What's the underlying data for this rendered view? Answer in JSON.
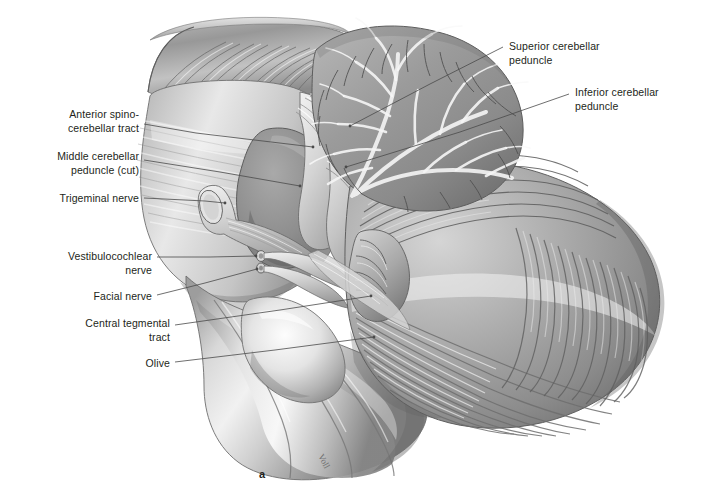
{
  "figure": {
    "panel_letter": "a",
    "signature": "Voll",
    "background_color": "#ffffff",
    "ink_color": "#231f20",
    "leader_color": "#4a4a4a"
  },
  "labels": [
    {
      "id": "anterior-spinocerebellar-tract",
      "lines": [
        "Anterior spino-",
        "cerebellar tract"
      ],
      "align": "right",
      "text_right": 139,
      "text_top": 108,
      "leader": [
        [
          144,
          124
        ],
        [
          196,
          133
        ],
        [
          313,
          147
        ]
      ]
    },
    {
      "id": "middle-cerebellar-peduncle-cut",
      "lines": [
        "Middle cerebellar",
        "peduncle (cut)"
      ],
      "align": "right",
      "text_top": 150,
      "text_right": 139,
      "leader": [
        [
          144,
          160
        ],
        [
          220,
          172
        ],
        [
          300,
          186
        ]
      ]
    },
    {
      "id": "trigeminal-nerve",
      "lines": [
        "Trigeminal nerve"
      ],
      "align": "right",
      "text_top": 192,
      "text_right": 139,
      "leader": [
        [
          144,
          198
        ],
        [
          205,
          201
        ],
        [
          225,
          203
        ]
      ]
    },
    {
      "id": "vestibulocochlear-nerve",
      "lines": [
        "Vestibulocochlear",
        "nerve"
      ],
      "align": "right",
      "text_top": 250,
      "text_right": 152,
      "leader": [
        [
          157,
          257
        ],
        [
          210,
          257
        ],
        [
          256,
          256
        ]
      ]
    },
    {
      "id": "facial-nerve",
      "lines": [
        "Facial nerve"
      ],
      "align": "right",
      "text_top": 290,
      "text_right": 152,
      "leader": [
        [
          157,
          295
        ],
        [
          205,
          283
        ],
        [
          257,
          269
        ]
      ]
    },
    {
      "id": "central-tegmental-tract",
      "lines": [
        "Central tegmental",
        "tract"
      ],
      "align": "right",
      "text_top": 317,
      "text_right": 170,
      "leader": [
        [
          175,
          325
        ],
        [
          280,
          310
        ],
        [
          371,
          296
        ]
      ]
    },
    {
      "id": "olive",
      "lines": [
        "Olive"
      ],
      "align": "right",
      "text_top": 357,
      "text_right": 170,
      "leader": [
        [
          175,
          362
        ],
        [
          275,
          350
        ],
        [
          374,
          337
        ]
      ]
    },
    {
      "id": "superior-cerebellar-peduncle",
      "lines": [
        "Superior cerebellar",
        "peduncle"
      ],
      "align": "left",
      "text_top": 40,
      "text_left": 509,
      "leader": [
        [
          503,
          47
        ],
        [
          430,
          84
        ],
        [
          350,
          126
        ]
      ]
    },
    {
      "id": "inferior-cerebellar-peduncle",
      "lines": [
        "Inferior cerebellar",
        "peduncle"
      ],
      "align": "left",
      "text_top": 86,
      "text_left": 575,
      "leader": [
        [
          569,
          94
        ],
        [
          460,
          132
        ],
        [
          346,
          167
        ]
      ]
    }
  ],
  "anatomy": {
    "structures": [
      {
        "id": "midbrain-cut-surface",
        "name": "Cut surface of midbrain / cerebral peduncle",
        "tone": "#9a9a9a"
      },
      {
        "id": "pons",
        "name": "Pons (basilar part)",
        "tone": "#c9c9c9"
      },
      {
        "id": "middle-cerebellar-peduncle-stump",
        "name": "Middle cerebellar peduncle, cut stump",
        "tone": "#8d8d8d"
      },
      {
        "id": "trigeminal-nerve-root",
        "name": "Trigeminal nerve root, cut",
        "tone": "#d6d6d6"
      },
      {
        "id": "vestibulocochlear-nerve-root",
        "name": "Vestibulocochlear nerve rootlets",
        "tone": "#b7b7b7"
      },
      {
        "id": "facial-nerve-root",
        "name": "Facial nerve root",
        "tone": "#b7b7b7"
      },
      {
        "id": "medulla-oblongata",
        "name": "Medulla oblongata with pyramid",
        "tone": "#b5b5b5"
      },
      {
        "id": "olive-body",
        "name": "Olive (inferior olivary eminence)",
        "tone": "#dcdcdc"
      },
      {
        "id": "cerebellum-vermis-section",
        "name": "Cerebellar vermis, sagittal section with arbor vitae",
        "tone": "#a3a3a3"
      },
      {
        "id": "cerebellar-hemisphere",
        "name": "Cerebellar hemisphere with folia",
        "tone": "#9e9e9e"
      },
      {
        "id": "superior-cerebellar-peduncle-fibers",
        "name": "Superior cerebellar peduncle fiber bundle",
        "tone": "#d2d2d2"
      },
      {
        "id": "inferior-cerebellar-peduncle-fibers",
        "name": "Inferior cerebellar peduncle fiber bundle",
        "tone": "#c4c4c4"
      }
    ]
  }
}
